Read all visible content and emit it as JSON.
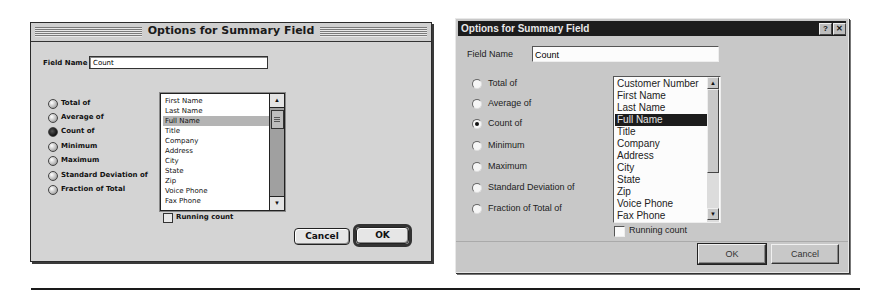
{
  "mac_dialog": {
    "title": "Options for Summary Field",
    "field_name_label": "Field Name",
    "field_name_value": "Count",
    "radio_options": [
      {
        "label": "Total of",
        "selected": false
      },
      {
        "label": "Average of",
        "selected": false
      },
      {
        "label": "Count of",
        "selected": true
      },
      {
        "label": "Minimum",
        "selected": false
      },
      {
        "label": "Maximum",
        "selected": false
      },
      {
        "label": "Standard Deviation of",
        "selected": false
      },
      {
        "label": "Fraction of Total",
        "selected": false
      }
    ],
    "fields_list": [
      "First Name",
      "Last Name",
      "Full Name",
      "Title",
      "Company",
      "Address",
      "City",
      "State",
      "Zip",
      "Voice Phone",
      "Fax Phone"
    ],
    "selected_field": "Full Name",
    "running_count_label": "Running count",
    "running_count_checked": false,
    "cancel_label": "Cancel",
    "ok_label": "OK",
    "scroll_up_icon": "▲",
    "scroll_down_icon": "▼"
  },
  "win_dialog": {
    "title": "Options for Summary Field",
    "help_button": "?",
    "close_button": "✕",
    "field_name_label": "Field Name",
    "field_name_value": "Count",
    "radio_options": [
      {
        "label": "Total of",
        "selected": false
      },
      {
        "label": "Average of",
        "selected": false
      },
      {
        "label": "Count of",
        "selected": true
      },
      {
        "label": "Minimum",
        "selected": false
      },
      {
        "label": "Maximum",
        "selected": false
      },
      {
        "label": "Standard Deviation of",
        "selected": false
      },
      {
        "label": "Fraction of Total of",
        "selected": false
      }
    ],
    "fields_list": [
      "Customer Number",
      "First Name",
      "Last Name",
      "Full Name",
      "Title",
      "Company",
      "Address",
      "City",
      "State",
      "Zip",
      "Voice Phone",
      "Fax Phone"
    ],
    "selected_field": "Full Name",
    "running_count_label": "Running count",
    "running_count_checked": false,
    "ok_label": "OK",
    "cancel_label": "Cancel",
    "scroll_up_icon": "▲",
    "scroll_down_icon": "▼"
  },
  "colors": {
    "mac_bg": "#d4d4d4",
    "win_bg": "#c8c8c8",
    "win_titlebar": "#1c1c1c",
    "selection_mac": "#b4b4b4",
    "selection_win": "#1c1c1c"
  }
}
